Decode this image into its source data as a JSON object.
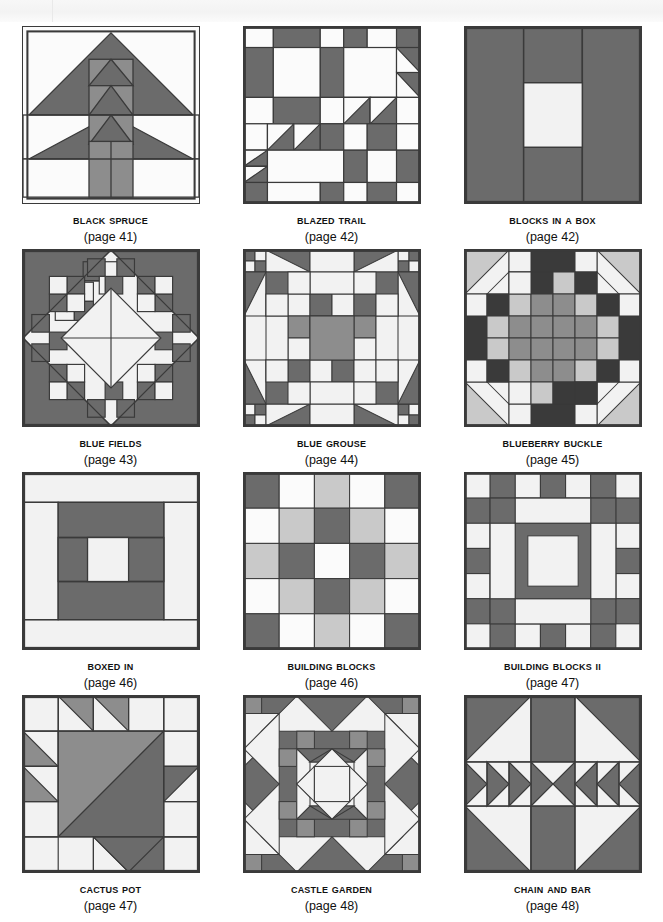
{
  "page": {
    "background": "#ffffff",
    "columns": 3,
    "rows": 4
  },
  "palette": {
    "white": "#fbfbfb",
    "offwhite": "#f2f2f2",
    "light": "#c9c9c9",
    "mid": "#8d8d8d",
    "dark": "#6b6b6b",
    "darkest": "#3a3a3a",
    "outline": "#3a3a3a",
    "text": "#111111"
  },
  "blocks": [
    {
      "name": "Black Spruce",
      "page": "(page 41)",
      "id": "black-spruce",
      "pattern": "tree-spruce"
    },
    {
      "name": "Blazed Trail",
      "page": "(page 42)",
      "id": "blazed-trail",
      "pattern": "blazed-trail-6x6"
    },
    {
      "name": "Blocks in a Box",
      "page": "(page 42)",
      "id": "blocks-in-a-box",
      "pattern": "box-center-square"
    },
    {
      "name": "Blue Fields",
      "page": "(page 43)",
      "id": "blue-fields",
      "pattern": "on-point-diamond"
    },
    {
      "name": "Blue Grouse",
      "page": "(page 44)",
      "id": "blue-grouse",
      "pattern": "grouse-8x8"
    },
    {
      "name": "Blueberry Buckle",
      "page": "(page 45)",
      "id": "blueberry-buckle",
      "pattern": "buckle-8x8"
    },
    {
      "name": "Boxed In",
      "page": "(page 46)",
      "id": "boxed-in",
      "pattern": "nested-rectangles"
    },
    {
      "name": "Building Blocks",
      "page": "(page 46)",
      "id": "building-blocks",
      "pattern": "checker-5x5"
    },
    {
      "name": "Building Blocks II",
      "page": "(page 47)",
      "id": "building-blocks-ii",
      "pattern": "checker-border-7x7"
    },
    {
      "name": "Cactus Pot",
      "page": "(page 47)",
      "id": "cactus-pot",
      "pattern": "cactus-basket"
    },
    {
      "name": "Castle Garden",
      "page": "(page 48)",
      "id": "castle-garden",
      "pattern": "castle-star"
    },
    {
      "name": "Chain and Bar",
      "page": "(page 48)",
      "id": "chain-and-bar",
      "pattern": "chain-bar-x"
    }
  ]
}
